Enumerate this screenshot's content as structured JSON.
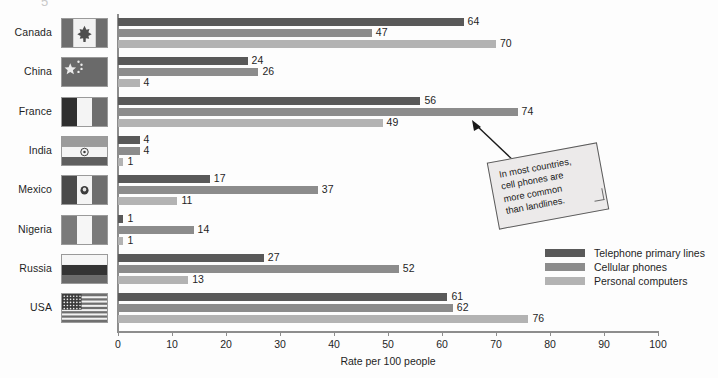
{
  "chart_data": {
    "type": "bar",
    "orientation": "horizontal",
    "title": "",
    "xlabel": "Rate per 100 people",
    "ylabel": "",
    "xlim": [
      0,
      100
    ],
    "xticks": [
      0,
      10,
      20,
      30,
      40,
      50,
      60,
      70,
      80,
      90,
      100
    ],
    "grid": false,
    "legend_position": "right",
    "categories": [
      "Canada",
      "China",
      "France",
      "India",
      "Mexico",
      "Nigeria",
      "Russia",
      "USA"
    ],
    "series": [
      {
        "name": "Telephone primary lines",
        "color": "#595959",
        "values": [
          64,
          24,
          56,
          4,
          17,
          1,
          27,
          61
        ]
      },
      {
        "name": "Cellular phones",
        "color": "#8c8c8c",
        "values": [
          47,
          26,
          74,
          4,
          37,
          14,
          52,
          62
        ]
      },
      {
        "name": "Personal computers",
        "color": "#b3b3b3",
        "values": [
          70,
          4,
          49,
          1,
          11,
          1,
          13,
          76
        ]
      }
    ],
    "annotations": [
      {
        "text": "In most countries,\ncell phones are\nmore common\nthan landlines.",
        "points_to": {
          "category": "France",
          "series": "Cellular phones",
          "value": 74
        }
      }
    ]
  },
  "axis": {
    "x_title": "Rate per 100 people",
    "tick_labels": [
      "0",
      "10",
      "20",
      "30",
      "40",
      "50",
      "60",
      "70",
      "80",
      "90",
      "100"
    ]
  },
  "legend": {
    "items": [
      {
        "label": "Telephone primary lines",
        "color": "#595959"
      },
      {
        "label": "Cellular phones",
        "color": "#8c8c8c"
      },
      {
        "label": "Personal computers",
        "color": "#b3b3b3"
      }
    ]
  },
  "callout": {
    "text": "In most countries,\ncell phones are\nmore common\nthan landlines."
  },
  "countries": [
    {
      "label": "Canada",
      "flag": "canada-flag",
      "values": {
        "telephone": 64,
        "cellular": 47,
        "computers": 70
      }
    },
    {
      "label": "China",
      "flag": "china-flag",
      "values": {
        "telephone": 24,
        "cellular": 26,
        "computers": 4
      }
    },
    {
      "label": "France",
      "flag": "france-flag",
      "values": {
        "telephone": 56,
        "cellular": 74,
        "computers": 49
      }
    },
    {
      "label": "India",
      "flag": "india-flag",
      "values": {
        "telephone": 4,
        "cellular": 4,
        "computers": 1
      }
    },
    {
      "label": "Mexico",
      "flag": "mexico-flag",
      "values": {
        "telephone": 17,
        "cellular": 37,
        "computers": 11
      }
    },
    {
      "label": "Nigeria",
      "flag": "nigeria-flag",
      "values": {
        "telephone": 1,
        "cellular": 14,
        "computers": 1
      }
    },
    {
      "label": "Russia",
      "flag": "russia-flag",
      "values": {
        "telephone": 27,
        "cellular": 52,
        "computers": 13
      }
    },
    {
      "label": "USA",
      "flag": "usa-flag",
      "values": {
        "telephone": 61,
        "cellular": 62,
        "computers": 76
      }
    }
  ],
  "top_cut_glyph": "5"
}
